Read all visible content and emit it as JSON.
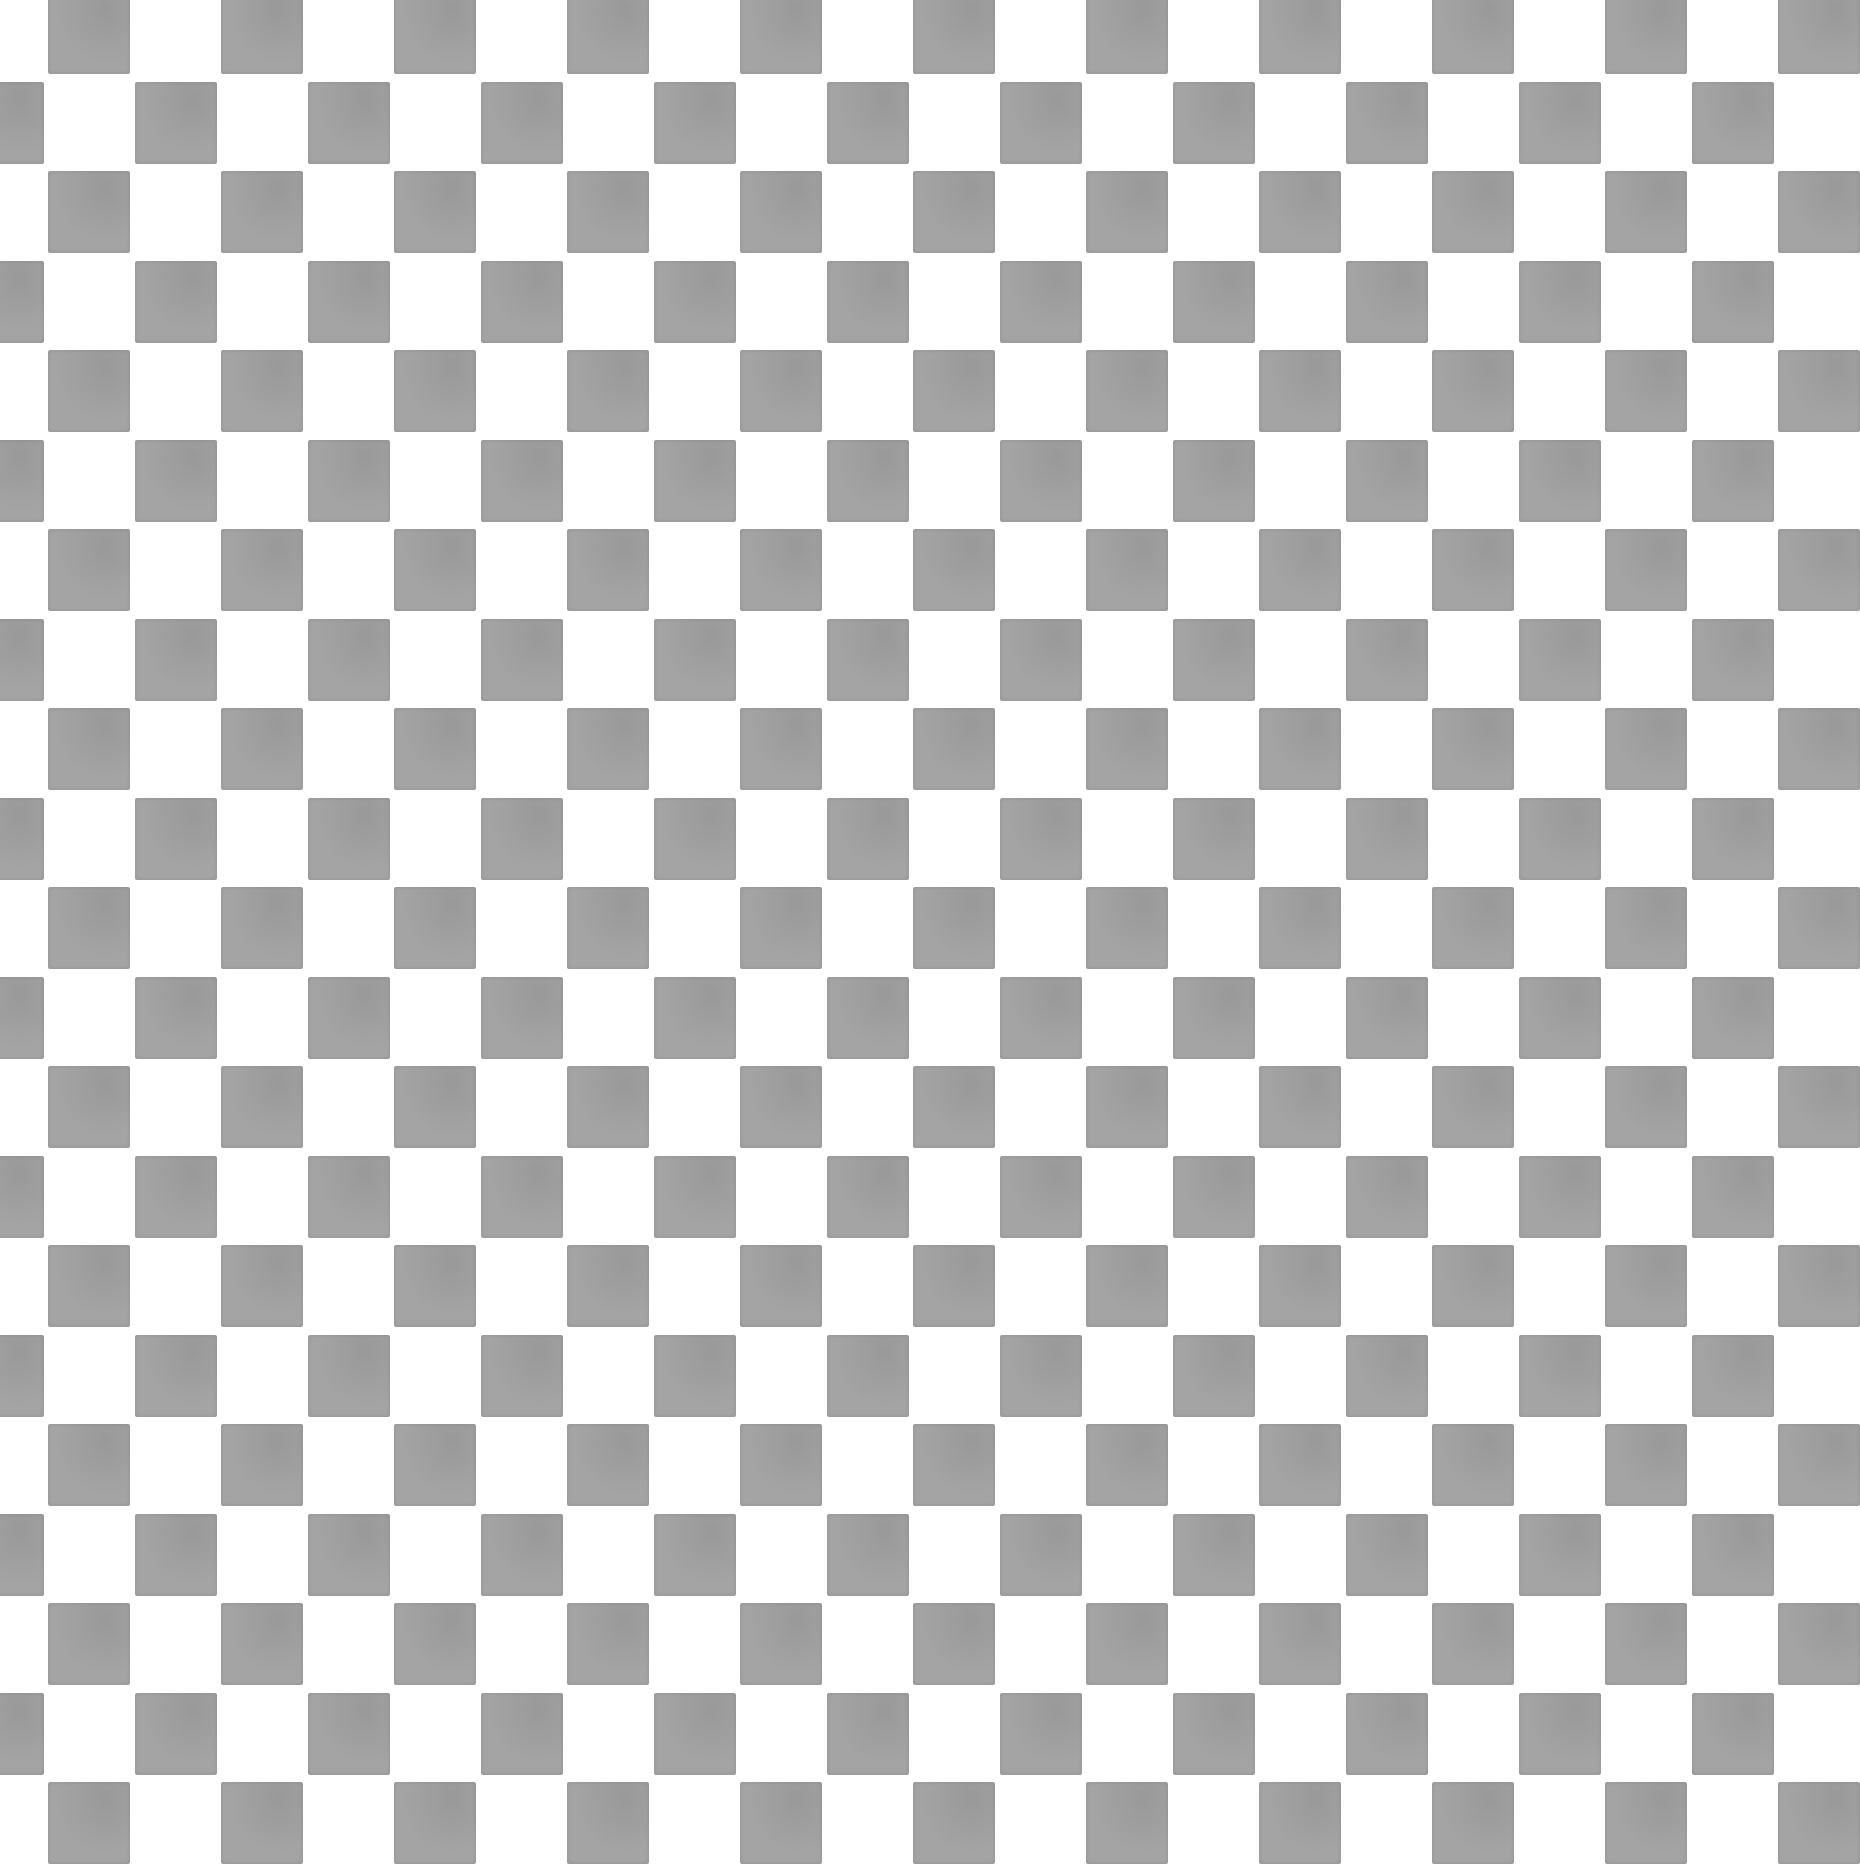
{
  "image": {
    "description": "Gray and white checkerboard texture",
    "width": 1566,
    "height": 1718,
    "pattern": {
      "type": "checkerboard",
      "cell_pitch_x": 95,
      "cell_pitch_y": 95,
      "dark_cell_width": 90,
      "dark_cell_height": 88,
      "columns": 17,
      "rows": 19,
      "odd_row_offset_x": 52,
      "even_row_offset_x": 0,
      "row_offset_y": -7
    },
    "colors": {
      "light": "#ffffff",
      "dark": "#a4a4a4"
    }
  }
}
